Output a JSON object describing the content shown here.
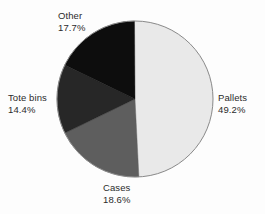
{
  "chart_data": {
    "type": "pie",
    "title": "",
    "subtitle": "",
    "xlabel": "",
    "ylabel": "",
    "grid": false,
    "legend_position": "none",
    "labels_position": "outside-callout",
    "total_percent": "99.9%",
    "categories": [
      "Pallets",
      "Cases",
      "Tote bins",
      "Other"
    ],
    "values": [
      49.2,
      18.6,
      14.4,
      17.7
    ],
    "value_labels": [
      "49.2%",
      "18.6%",
      "14.4%",
      "17.7%"
    ],
    "slices": [
      {
        "name": "Pallets",
        "label": "Pallets",
        "value": 49.2,
        "value_label": "49.2%",
        "color": "#e9e9e9",
        "start_angle_deg": 0.0,
        "end_angle_deg": 177.12
      },
      {
        "name": "Cases",
        "label": "Cases",
        "value": 18.6,
        "value_label": "18.6%",
        "color": "#5e5e5e",
        "start_angle_deg": 177.12,
        "end_angle_deg": 244.08
      },
      {
        "name": "Tote bins",
        "label": "Tote bins",
        "value": 14.4,
        "value_label": "14.4%",
        "color": "#272727",
        "start_angle_deg": 244.08,
        "end_angle_deg": 295.92
      },
      {
        "name": "Other",
        "label": "Other",
        "value": 17.7,
        "value_label": "17.7%",
        "color": "#0d0d0d",
        "start_angle_deg": 295.92,
        "end_angle_deg": 359.64
      }
    ],
    "geometry": {
      "center_x": 135,
      "center_y": 99,
      "radius": 78,
      "outline_color": "#8a8a8a",
      "background": "#fdfdfd"
    }
  }
}
